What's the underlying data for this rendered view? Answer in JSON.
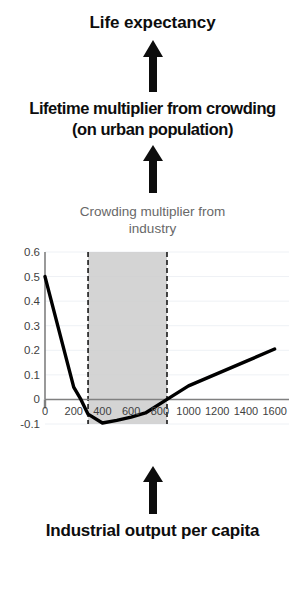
{
  "diagram": {
    "top_label": "Life expectancy",
    "mid_label_line1": "Lifetime multiplier from crowding",
    "mid_label_line2": "(on urban population)",
    "bottom_label": "Industrial output per capita",
    "arrow_top_icon": "up-arrow-icon",
    "arrow_mid_icon": "up-arrow-icon",
    "arrow_bottom_icon": "up-arrow-icon"
  },
  "chart_data": {
    "type": "line",
    "title": "Crowding multiplier from industry",
    "title_line1": "Crowding multiplier from",
    "title_line2": "industry",
    "xlabel": "",
    "ylabel": "",
    "xlim": [
      0,
      1700
    ],
    "ylim": [
      -0.1,
      0.6
    ],
    "grid": true,
    "legend": "none",
    "x_ticks": [
      "0",
      "200",
      "400",
      "600",
      "800",
      "1000",
      "1200",
      "1400",
      "1600"
    ],
    "x_tick_values": [
      0,
      200,
      400,
      600,
      800,
      1000,
      1200,
      1400,
      1600
    ],
    "y_ticks": [
      "0.6",
      "0.5",
      "0.4",
      "0.3",
      "0.2",
      "0.1",
      "0",
      "-0.1"
    ],
    "y_tick_values": [
      0.6,
      0.5,
      0.4,
      0.3,
      0.2,
      0.1,
      0,
      -0.1
    ],
    "series": [
      {
        "name": "Crowding multiplier from industry",
        "color": "#000000",
        "x": [
          0,
          200,
          250,
          300,
          400,
          500,
          600,
          700,
          850,
          1000,
          1200,
          1400,
          1600
        ],
        "values": [
          0.5,
          0.05,
          0.0,
          -0.06,
          -0.096,
          -0.085,
          -0.072,
          -0.055,
          0.0,
          0.055,
          0.105,
          0.155,
          0.205
        ]
      }
    ],
    "shaded_band": {
      "label": "highlighted range",
      "x_start": 300,
      "x_end": 850,
      "fill": "#cccccc",
      "edge": "#1a1a1a",
      "edge_style": "dashed"
    },
    "zero_line": {
      "y": 0,
      "color": "#808080"
    },
    "axis_color": "#808080",
    "grid_color": "#eef1f5"
  }
}
